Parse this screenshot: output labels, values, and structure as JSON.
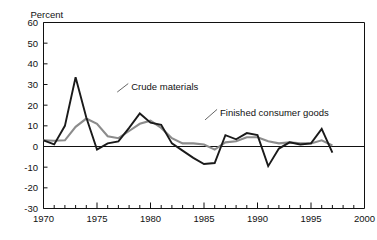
{
  "chart_data": {
    "type": "line",
    "title": "",
    "subtitle": "",
    "xlabel": "",
    "ylabel": "Percent",
    "unit_label": "Percent",
    "xlim": [
      1970,
      2000
    ],
    "ylim": [
      -30,
      60
    ],
    "grid": false,
    "legend_position": "inline-annotations",
    "y_ticks": [
      60,
      50,
      40,
      30,
      20,
      10,
      0,
      -10,
      -20,
      -30
    ],
    "y_tick_labels": [
      "60",
      "50",
      "40",
      "30",
      "20",
      "10",
      "0",
      "-10",
      "-20",
      "-30"
    ],
    "x_ticks": [
      1970,
      1975,
      1980,
      1985,
      1990,
      1995,
      2000
    ],
    "x_tick_labels": [
      "1970",
      "1975",
      "1980",
      "1985",
      "1990",
      "1995",
      "2000"
    ],
    "x_minor_tick_step": 1,
    "zero_line": 0,
    "x": [
      1970,
      1971,
      1972,
      1973,
      1974,
      1975,
      1976,
      1977,
      1978,
      1979,
      1980,
      1981,
      1982,
      1983,
      1984,
      1985,
      1986,
      1987,
      1988,
      1989,
      1990,
      1991,
      1992,
      1993,
      1994,
      1995,
      1996,
      1997
    ],
    "series": [
      {
        "name": "Crude materials",
        "color": "#1a1a1a",
        "width": 1.9,
        "values": [
          3.0,
          1.0,
          10.0,
          33.5,
          14.0,
          -1.5,
          1.5,
          2.5,
          9.0,
          16.0,
          11.5,
          10.5,
          1.5,
          -2.0,
          -5.5,
          -8.5,
          -8.0,
          5.5,
          3.5,
          6.5,
          5.5,
          -9.5,
          -1.0,
          2.0,
          1.0,
          1.5,
          8.5,
          -3.0
        ],
        "label_text": "Crude materials",
        "label_x": 1978.2,
        "label_y": 29.0
      },
      {
        "name": "Finished consumer goods",
        "color": "#8c8c8c",
        "width": 2.1,
        "values": [
          3.0,
          2.8,
          3.0,
          9.5,
          13.5,
          11.0,
          5.0,
          4.0,
          7.5,
          11.0,
          12.5,
          9.0,
          4.0,
          1.5,
          1.5,
          1.0,
          -1.5,
          2.0,
          2.5,
          4.5,
          4.5,
          2.5,
          1.5,
          2.0,
          1.5,
          1.5,
          3.0,
          0.5
        ],
        "label_text": "Finished consumer goods",
        "label_x": 1986.5,
        "label_y": 16.5
      }
    ]
  },
  "annotations": {
    "crude_label": "Crude materials",
    "finished_label": "Finished consumer goods"
  },
  "colors": {
    "crude": "#1a1a1a",
    "finished": "#8c8c8c",
    "axis": "#111111",
    "background": "#ffffff"
  }
}
